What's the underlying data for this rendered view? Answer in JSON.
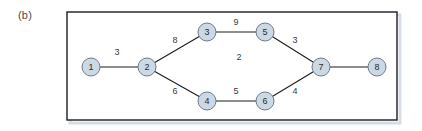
{
  "figure": {
    "panel_label": "(b)",
    "frame": {
      "x": 67,
      "y": 12,
      "width": 330,
      "height": 108,
      "border_color": "#1c1c24",
      "shadow_color": "#c8d2dc"
    },
    "background_color": "#ffffff"
  },
  "style": {
    "node_fill": "#ccd9e5",
    "node_stroke": "#6d7b88",
    "node_radius": 9,
    "edge_color": "#1c1c1c",
    "label_color": "#3a3a3a",
    "weight_color": "#3a3a3a"
  },
  "chart_data": {
    "type": "diagram",
    "title": "(b)",
    "graph_kind": "undirected weighted graph",
    "nodes": [
      {
        "id": "1",
        "label": "1",
        "x": 91,
        "y": 67
      },
      {
        "id": "2",
        "label": "2",
        "x": 147,
        "y": 67
      },
      {
        "id": "3",
        "label": "3",
        "x": 207,
        "y": 32
      },
      {
        "id": "4",
        "label": "4",
        "x": 207,
        "y": 101
      },
      {
        "id": "5",
        "label": "5",
        "x": 265,
        "y": 32
      },
      {
        "id": "6",
        "label": "6",
        "x": 265,
        "y": 101
      },
      {
        "id": "7",
        "label": "7",
        "x": 321,
        "y": 67
      },
      {
        "id": "8",
        "label": "8",
        "x": 377,
        "y": 67
      }
    ],
    "edges": [
      {
        "source": "1",
        "target": "2",
        "weight": "3",
        "label_x": 117,
        "label_y": 53
      },
      {
        "source": "2",
        "target": "3",
        "weight": "8",
        "label_x": 175,
        "label_y": 41
      },
      {
        "source": "2",
        "target": "4",
        "weight": "6",
        "label_x": 175,
        "label_y": 92
      },
      {
        "source": "3",
        "target": "5",
        "weight": "9",
        "label_x": 236,
        "label_y": 23
      },
      {
        "source": "4",
        "target": "6",
        "weight": "5",
        "label_x": 236,
        "label_y": 92
      },
      {
        "source": "5",
        "target": "7",
        "weight": "3",
        "label_x": 295,
        "label_y": 41
      },
      {
        "source": "6",
        "target": "7",
        "weight": "4",
        "label_x": 295,
        "label_y": 92
      },
      {
        "source": "7",
        "target": "8",
        "weight": "",
        "label_x": 349,
        "label_y": 57
      }
    ],
    "annotations": [
      {
        "text": "2",
        "x": 239,
        "y": 58,
        "note": "face/region label inside the cycle"
      }
    ]
  }
}
